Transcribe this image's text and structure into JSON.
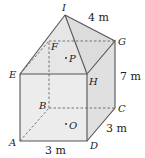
{
  "diagram": {
    "type": "composite solid: rectangular prism with pyramid on top",
    "colors": {
      "face_front": "#ececec",
      "face_side": "#e0e0e0",
      "face_top": "#e4e4e4",
      "edge": "#555555",
      "hidden_edge": "#666666"
    },
    "vertices": {
      "A": {
        "label": "A",
        "x": 20,
        "y": 141
      },
      "B": {
        "label": "B",
        "x": 49,
        "y": 108
      },
      "C": {
        "label": "C",
        "x": 115,
        "y": 108
      },
      "D": {
        "label": "D",
        "x": 87,
        "y": 141
      },
      "E": {
        "label": "E",
        "x": 20,
        "y": 74
      },
      "F": {
        "label": "F",
        "x": 49,
        "y": 41
      },
      "G": {
        "label": "G",
        "x": 115,
        "y": 41
      },
      "H": {
        "label": "H",
        "x": 87,
        "y": 74
      },
      "I": {
        "label": "I",
        "x": 65,
        "y": 15
      }
    },
    "points": {
      "P": {
        "label": "P"
      },
      "O": {
        "label": "O"
      }
    },
    "dimensions": {
      "slant_edge_IG": "4 m",
      "height_HD": "7 m",
      "depth_DC": "3 m",
      "width_AD": "3 m"
    }
  }
}
